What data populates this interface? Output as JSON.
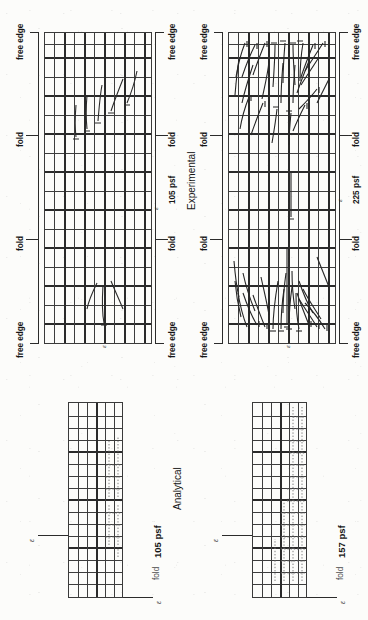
{
  "figure": {
    "orientation": "rotated-90-ccw",
    "column_titles": {
      "left": "Experimental",
      "right": "Analytical"
    }
  },
  "panels": [
    {
      "id": "experimental-105",
      "kind": "experimental",
      "load_label": "105 psf",
      "edge_labels_top": [
        "free edge",
        "fold",
        "fold",
        "free edge"
      ],
      "edge_labels_bottom": [
        "free edge",
        "fold",
        "free edge"
      ],
      "center_symbol": "ε",
      "grid": {
        "cols": 16,
        "rows": 11
      },
      "crack_count": 9
    },
    {
      "id": "experimental-225",
      "kind": "experimental",
      "load_label": "225 psf",
      "edge_labels_top": [
        "free edge",
        "fold",
        "fold",
        "free edge"
      ],
      "edge_labels_bottom": [
        "free edge",
        "fold",
        "free edge"
      ],
      "center_symbol": "ε",
      "grid": {
        "cols": 16,
        "rows": 11
      },
      "crack_count": 46
    },
    {
      "id": "analytical-105",
      "kind": "analytical",
      "load_label": "105 psf",
      "fold_label": "fold",
      "center_symbol": "ε",
      "corner_symbol": "ε",
      "grid": {
        "cols": 16,
        "rows": 6
      }
    },
    {
      "id": "analytical-157",
      "kind": "analytical",
      "load_label": "157 psf",
      "fold_label": "fold",
      "center_symbol": "ε",
      "corner_symbol": "ε",
      "grid": {
        "cols": 16,
        "rows": 6
      }
    }
  ],
  "labels": {
    "free_edge": "free edge",
    "fold": "fold",
    "load_105": "105 psf",
    "load_225": "225 psf",
    "load_157": "157 psf",
    "experimental": "Experimental",
    "analytical": "Analytical",
    "epsilon": "ε"
  },
  "colors": {
    "ink": "#2b2b2b",
    "grid": "#3d3d3d",
    "light_grid": "#9a9a9a",
    "paper": "#fcfcfa",
    "dots": "#6d6d6d"
  }
}
